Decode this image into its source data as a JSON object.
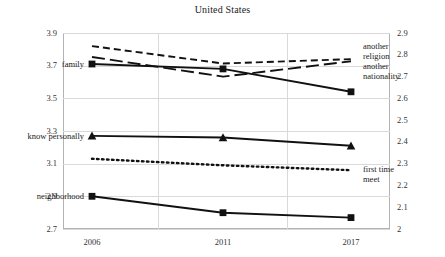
{
  "chart_data": {
    "type": "line",
    "title": "United States",
    "xlabel": "",
    "ylabel": "",
    "categories": [
      "2006",
      "2011",
      "2017"
    ],
    "x": [
      2006,
      2011,
      2017
    ],
    "grid": true,
    "legend_position": "inline-labels",
    "left_axis": {
      "ylim": [
        2.7,
        3.9
      ],
      "ticks": [
        "2.7",
        "2.9",
        "3.1",
        "3.3",
        "3.5",
        "3.7",
        "3.9"
      ],
      "tick_values": [
        2.7,
        2.9,
        3.1,
        3.3,
        3.5,
        3.7,
        3.9
      ]
    },
    "right_axis": {
      "ylim": [
        2.0,
        2.9
      ],
      "ticks": [
        "2",
        "2.1",
        "2.2",
        "2.3",
        "2.4",
        "2.5",
        "2.6",
        "2.7",
        "2.8",
        "2.9"
      ],
      "tick_values": [
        2.0,
        2.1,
        2.2,
        2.3,
        2.4,
        2.5,
        2.6,
        2.7,
        2.8,
        2.9
      ]
    },
    "series": [
      {
        "name": "another religion",
        "label": "another religion",
        "axis": "right",
        "style": "short-dash",
        "marker": "none",
        "label_side": "right",
        "values": [
          2.84,
          2.76,
          2.78
        ]
      },
      {
        "name": "another nationality",
        "label": "another nationality",
        "axis": "right",
        "style": "long-dash",
        "marker": "none",
        "label_side": "right",
        "values": [
          2.79,
          2.7,
          2.77
        ]
      },
      {
        "name": "family",
        "label": "family",
        "axis": "left",
        "style": "solid",
        "marker": "square",
        "label_side": "left",
        "values": [
          3.71,
          3.68,
          3.54
        ]
      },
      {
        "name": "know personally",
        "label": "know personally",
        "axis": "left",
        "style": "solid",
        "marker": "triangle",
        "label_side": "left",
        "values": [
          3.27,
          3.26,
          3.21
        ]
      },
      {
        "name": "first time meet",
        "label": "first time meet",
        "axis": "left",
        "style": "dotted",
        "marker": "none",
        "label_side": "right",
        "values": [
          3.13,
          3.09,
          3.06
        ]
      },
      {
        "name": "neighborhood",
        "label": "neighborhood",
        "axis": "left",
        "style": "solid",
        "marker": "square",
        "label_side": "left",
        "values": [
          2.9,
          2.8,
          2.77
        ]
      }
    ],
    "colors": {
      "series": "#111111",
      "grid": "#d9d9d9",
      "axis": "#b3b3b3",
      "text": "#1a1a1a"
    }
  }
}
